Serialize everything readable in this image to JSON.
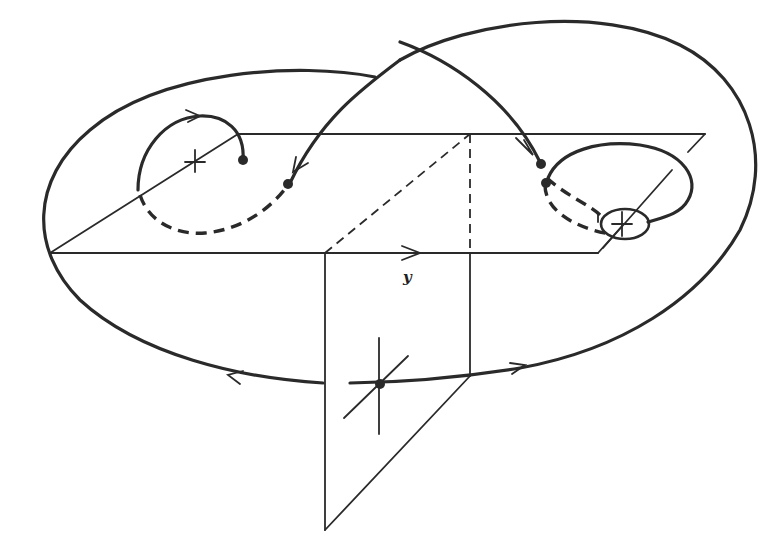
{
  "figure": {
    "axis_label": "y",
    "colors": {
      "ink": "#2a2a2a",
      "background": "#ffffff"
    },
    "elements": {
      "horizontal_plane": "parallelogram",
      "vertical_plane": "trapezoid below horizontal plane",
      "outer_orbit": "large closed loop with direction arrows",
      "figure_eight_trajectory": "curve crossing between left and right spirals",
      "left_equilibrium": "saddle cross with spiral",
      "right_equilibrium": "cross inside small loop",
      "lower_equilibrium": "cross with dot on vertical plane"
    }
  }
}
